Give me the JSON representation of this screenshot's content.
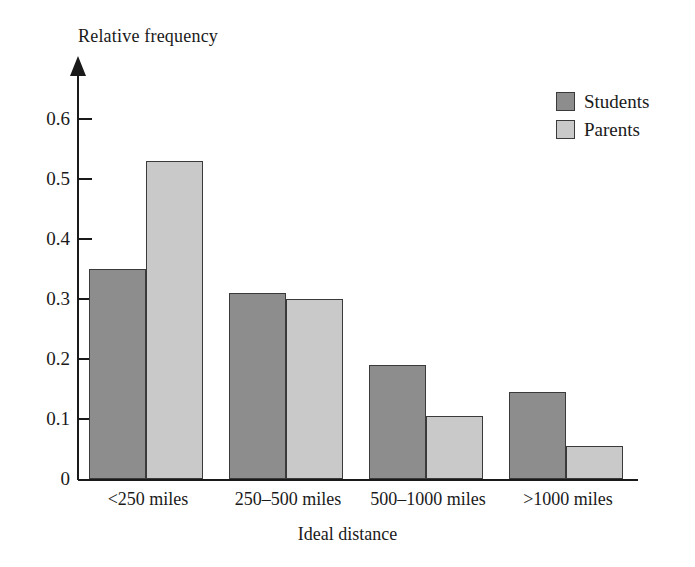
{
  "chart_data": {
    "type": "bar",
    "title": "",
    "xlabel": "Ideal distance",
    "ylabel": "Relative frequency",
    "categories": [
      "<250 miles",
      "250–500 miles",
      "500–1000 miles",
      ">1000 miles"
    ],
    "series": [
      {
        "name": "Students",
        "color": "#8d8d8d",
        "values": [
          0.35,
          0.31,
          0.19,
          0.145
        ]
      },
      {
        "name": "Parents",
        "color": "#c9c9c9",
        "values": [
          0.53,
          0.3,
          0.105,
          0.055
        ]
      }
    ],
    "ylim": [
      0,
      0.65
    ],
    "yticks": [
      0,
      0.1,
      0.2,
      0.3,
      0.4,
      0.5,
      0.6
    ],
    "ytick_labels": [
      "0",
      "0.1",
      "0.2",
      "0.3",
      "0.4",
      "0.5",
      "0.6"
    ],
    "grid": false,
    "legend_position": "top-right",
    "bar_layout": "grouped"
  },
  "legend": {
    "entries": [
      {
        "label": "Students",
        "color": "#8d8d8d"
      },
      {
        "label": "Parents",
        "color": "#c9c9c9"
      }
    ]
  }
}
